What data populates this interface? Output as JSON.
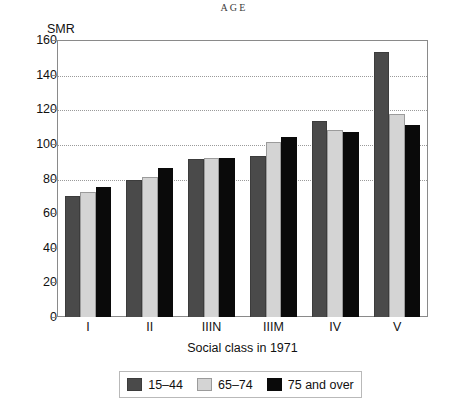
{
  "chart_data": {
    "type": "bar",
    "title": "AGE",
    "xlabel": "Social class in 1971",
    "ylabel": "SMR",
    "categories": [
      "I",
      "II",
      "IIIN",
      "IIIM",
      "IV",
      "V"
    ],
    "series": [
      {
        "name": "15–44",
        "color": "#4a4a4a",
        "values": [
          70,
          79,
          91,
          93,
          113,
          153
        ]
      },
      {
        "name": "65–74",
        "color": "#d4d4d4",
        "values": [
          72,
          81,
          92,
          101,
          108,
          117
        ]
      },
      {
        "name": "75 and over",
        "color": "#0a0a0a",
        "values": [
          75,
          86,
          92,
          104,
          107,
          111
        ]
      }
    ],
    "ylim": [
      0,
      160
    ],
    "yticks": [
      0,
      20,
      40,
      60,
      80,
      100,
      120,
      140,
      160
    ],
    "ytick_labels": [
      "0",
      "20",
      "40",
      "60",
      "80",
      "100",
      "120",
      "140",
      "160"
    ],
    "gridlines_at": [
      80,
      100,
      120,
      140
    ],
    "grid": true,
    "legend_position": "bottom"
  },
  "legend": {
    "items": [
      {
        "label": "15–44"
      },
      {
        "label": "65–74"
      },
      {
        "label": "75 and over"
      }
    ]
  }
}
